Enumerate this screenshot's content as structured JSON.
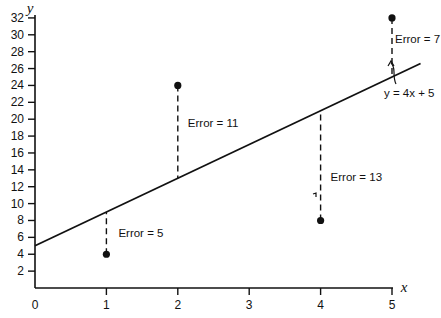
{
  "chart_data": {
    "type": "scatter",
    "title": "",
    "xlabel": "x",
    "ylabel": "y",
    "xlim": [
      0,
      5.4
    ],
    "ylim": [
      0,
      32
    ],
    "grid": false,
    "x_ticks": [
      "0",
      "1",
      "2",
      "3",
      "4",
      "5"
    ],
    "y_ticks": [
      "2",
      "4",
      "6",
      "8",
      "10",
      "12",
      "14",
      "16",
      "18",
      "20",
      "22",
      "24",
      "26",
      "28",
      "30",
      "32"
    ],
    "points": [
      {
        "x": 1,
        "y": 4
      },
      {
        "x": 2,
        "y": 24
      },
      {
        "x": 4,
        "y": 8
      },
      {
        "x": 5,
        "y": 32
      }
    ],
    "fit_line": {
      "slope": 4,
      "intercept": 5,
      "label": "y = 4x + 5"
    },
    "residuals": [
      {
        "x": 1,
        "label": "Error = 5"
      },
      {
        "x": 2,
        "label": "Error = 11"
      },
      {
        "x": 4,
        "label": "Error = 13"
      },
      {
        "x": 5,
        "label": "Error = 7"
      }
    ]
  }
}
